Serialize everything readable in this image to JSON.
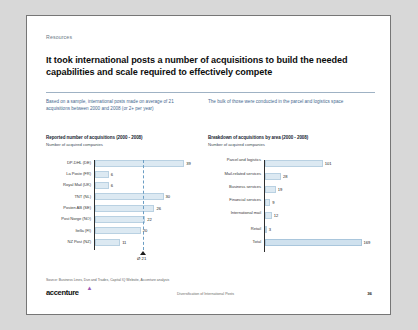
{
  "slide": {
    "eyebrow": "Resources",
    "headline": "It took international posts a number of acquisitions to build the needed capabilities and scale required to effectively compete",
    "subtitle_left": "Based on a sample, international posts made on average of 21 acquisitions between 2000 and 2008 (or 2+ per year)",
    "subtitle_right": "The bulk of those were conducted in the parcel and logistics space",
    "accent_color": "#46698f",
    "bar_color": "#dce9f2",
    "source": "Source:  Business Lines, Dun and Trades, Capital IQ Website, Accenture analysis",
    "logo": "accenture",
    "footer_center": "Diversification of International Posts",
    "page_number": "36"
  },
  "chart_data": [
    {
      "type": "bar",
      "orientation": "horizontal",
      "title": "Reported number of acquisitions (2000 - 2008)",
      "subtitle": "Number of acquired companies",
      "xlabel": "",
      "ylabel": "",
      "categories": [
        "DP-DHL (DE)",
        "La Poste (FR)",
        "Royal Mail (UK)",
        "TNT (NL)",
        "Posten AB (SE)",
        "Post Norge (NO)",
        "Itella (FI)",
        "NZ Post (NZ)"
      ],
      "values": [
        39,
        6,
        6,
        30,
        26,
        22,
        20,
        11
      ],
      "xlim": [
        0,
        42
      ],
      "grid": false,
      "annotation": {
        "label": "Ø 21",
        "value": 21
      }
    },
    {
      "type": "bar",
      "orientation": "horizontal",
      "title": "Breakdown of acquisitions by area (2000 - 2008)",
      "subtitle": "Number of acquired companies",
      "xlabel": "",
      "ylabel": "",
      "categories": [
        "Parcel and logistics",
        "Mail-related services",
        "Business services",
        "Financial services",
        "International mail",
        "Retail",
        "Total"
      ],
      "values": [
        101,
        28,
        19,
        9,
        12,
        3,
        169
      ],
      "xlim": [
        0,
        175
      ],
      "grid": false
    }
  ]
}
